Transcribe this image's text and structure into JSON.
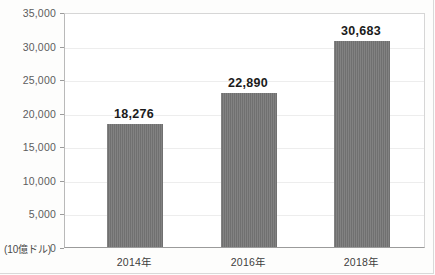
{
  "chart_data": {
    "type": "bar",
    "title": "",
    "subtitle": "",
    "xlabel": "",
    "ylabel": "(10億ドル)",
    "unit_label": "(10億ドル)",
    "categories": [
      "2014年",
      "2016年",
      "2018年"
    ],
    "values": [
      18276,
      22890,
      30683
    ],
    "value_labels": [
      "18,276",
      "22,890",
      "30,683"
    ],
    "ylim": [
      0,
      35000
    ],
    "ytick_values": [
      0,
      5000,
      10000,
      15000,
      20000,
      25000,
      30000,
      35000
    ],
    "ytick_labels": [
      "0",
      "5,000",
      "10,000",
      "15,000",
      "20,000",
      "25,000",
      "30,000",
      "35,000"
    ],
    "grid": true,
    "legend": "none",
    "legend_position": "none",
    "series": [
      {
        "name": "",
        "values": [
          18276,
          22890,
          30683
        ],
        "color": "#767676"
      }
    ],
    "colors": {
      "bar": "#767676",
      "gridline": "#ededed",
      "axis": "#9b9b9b",
      "plot_border": "#d6d6d6",
      "tick_text": "#5c5c5c",
      "label_text": "#1b1b1b",
      "background": "#ffffff",
      "page_background": "#fdfdfc"
    }
  }
}
